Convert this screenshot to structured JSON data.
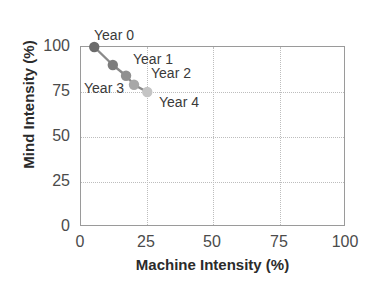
{
  "chart_data": {
    "type": "scatter",
    "title": "",
    "xlabel": "Machine Intensity (%)",
    "ylabel": "Mind Intensity (%)",
    "xlim": [
      0,
      100
    ],
    "ylim": [
      0,
      100
    ],
    "xticks": [
      "0",
      "25",
      "50",
      "75",
      "100"
    ],
    "yticks": [
      "0",
      "25",
      "50",
      "75",
      "100"
    ],
    "grid": true,
    "legend": "none",
    "series": [
      {
        "name": "Mind vs Machine Intensity trajectory",
        "points": [
          {
            "label": "Year 0",
            "x": 5,
            "y": 100,
            "color": "#6b6b6b"
          },
          {
            "label": "Year 1",
            "x": 12,
            "y": 90,
            "color": "#7d7d7d"
          },
          {
            "label": "Year 2",
            "x": 17,
            "y": 84,
            "color": "#919191"
          },
          {
            "label": "Year 3",
            "x": 20,
            "y": 79,
            "color": "#a8a8a8"
          },
          {
            "label": "Year 4",
            "x": 25,
            "y": 75,
            "color": "#c4c4c4"
          }
        ]
      }
    ],
    "annotations": [
      {
        "text": "Year 0",
        "x": 5,
        "y": 100
      },
      {
        "text": "Year 1",
        "x": 12,
        "y": 90
      },
      {
        "text": "Year 2",
        "x": 17,
        "y": 84
      },
      {
        "text": "Year 3",
        "x": 20,
        "y": 79
      },
      {
        "text": "Year 4",
        "x": 25,
        "y": 75
      }
    ]
  },
  "axes": {
    "x_title": "Machine Intensity (%)",
    "y_title": "Mind Intensity (%)",
    "x_ticks": [
      {
        "value": 0,
        "text": "0"
      },
      {
        "value": 25,
        "text": "25"
      },
      {
        "value": 50,
        "text": "50"
      },
      {
        "value": 75,
        "text": "75"
      },
      {
        "value": 100,
        "text": "100"
      }
    ],
    "y_ticks": [
      {
        "value": 0,
        "text": "0"
      },
      {
        "value": 25,
        "text": "25"
      },
      {
        "value": 50,
        "text": "50"
      },
      {
        "value": 75,
        "text": "75"
      },
      {
        "value": 100,
        "text": "100"
      }
    ]
  },
  "colors": {
    "frame": "#9a9a9a",
    "grid": "#bdbdbd",
    "line": "#8a8a8a",
    "tick_text": "#4b4b4b",
    "axis_title": "#2b2b2b",
    "label_text": "#3a3a3a",
    "background": "#ffffff"
  },
  "point_labels": {
    "year0": "Year 0",
    "year1": "Year 1",
    "year2": "Year 2",
    "year3": "Year 3",
    "year4": "Year 4"
  }
}
